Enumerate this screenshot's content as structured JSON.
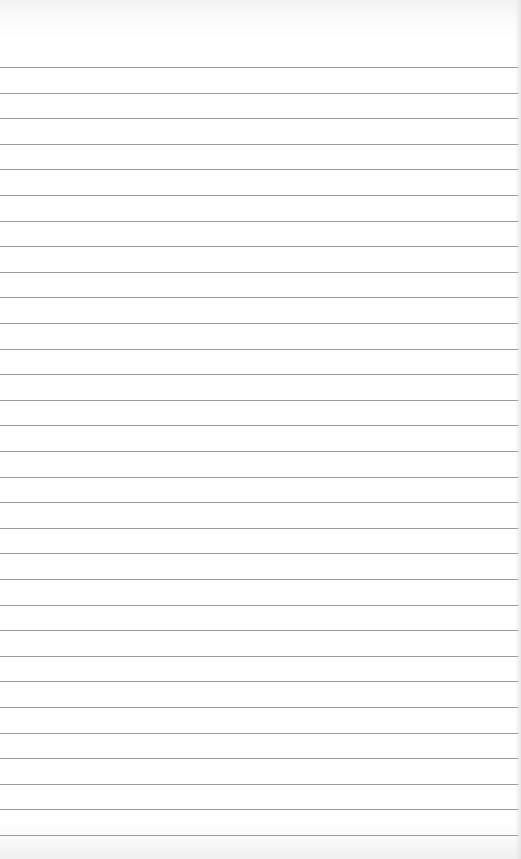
{
  "page": {
    "type": "blank lined paper",
    "background_color": "#ffffff",
    "rule_color": "#9a9a9a"
  },
  "rules": {
    "count": 31,
    "first_y": 67,
    "pitch": 25.6,
    "width": 519
  }
}
